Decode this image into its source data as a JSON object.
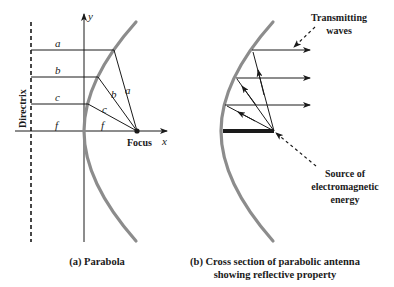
{
  "panel_a": {
    "caption": "(a) Parabola",
    "directrix_label": "Directrix",
    "axis_x_label": "x",
    "axis_y_label": "y",
    "focus_label": "Focus",
    "segment_labels": {
      "a_left": "a",
      "b_left": "b",
      "c_left": "c",
      "f_left": "f",
      "a_right": "a",
      "b_right": "b",
      "c_right": "c",
      "f_right": "f"
    }
  },
  "panel_b": {
    "caption_line1": "(b) Cross section of parabolic antenna",
    "caption_line2": "showing reflective property",
    "transmit_label_line1": "Transmitting",
    "transmit_label_line2": "waves",
    "source_label_line1": "Source of",
    "source_label_line2": "electromagnetic",
    "source_label_line3": "energy"
  },
  "colors": {
    "curve": "#8c8c8c",
    "lines": "#1a1a1a"
  }
}
